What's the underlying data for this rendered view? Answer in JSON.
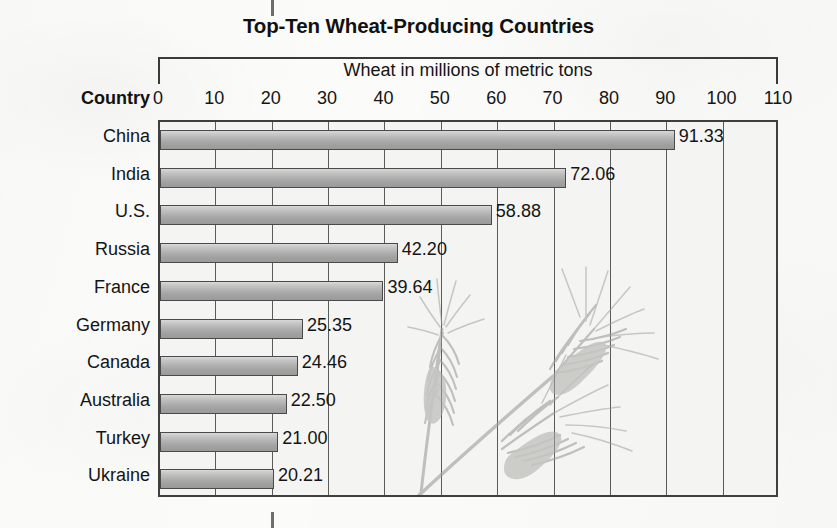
{
  "chart_data": {
    "type": "bar",
    "orientation": "horizontal",
    "title": "Top-Ten Wheat-Producing Countries",
    "xlabel": "Wheat in millions of metric tons",
    "ylabel": "Country",
    "categories": [
      "China",
      "India",
      "U.S.",
      "Russia",
      "France",
      "Germany",
      "Canada",
      "Australia",
      "Turkey",
      "Ukraine"
    ],
    "values": [
      91.33,
      72.06,
      58.88,
      42.2,
      39.64,
      25.35,
      24.46,
      22.5,
      21.0,
      20.21
    ],
    "value_labels": [
      "91.33",
      "72.06",
      "58.88",
      "42.20",
      "39.64",
      "25.35",
      "24.46",
      "22.50",
      "21.00",
      "20.21"
    ],
    "xlim": [
      0,
      110
    ],
    "xticks": [
      0,
      10,
      20,
      30,
      40,
      50,
      60,
      70,
      80,
      90,
      100,
      110
    ],
    "xtick_labels": [
      "0",
      "10",
      "20",
      "30",
      "40",
      "50",
      "60",
      "70",
      "80",
      "90",
      "100",
      "110"
    ],
    "grid": "vertical",
    "legend": "none",
    "annotations": [
      "wheat-stalks-illustration"
    ],
    "colors": {
      "bar_fill_light": "#d9d9d9",
      "bar_fill_mid": "#b0b0b0",
      "bar_fill_dark": "#9a9a9a",
      "bar_border": "#4a4a4a",
      "gridline": "#5a5a5a",
      "plot_border": "#3f3f3f",
      "plot_background": "#f4f4f2",
      "page_background": "#fbfbfa",
      "text": "#141414",
      "wheat_illustration": "#9fa09c"
    }
  },
  "icons": {
    "wheat_stalk": "wheat-stalk-icon",
    "crop_mark": "crop-mark-icon"
  }
}
